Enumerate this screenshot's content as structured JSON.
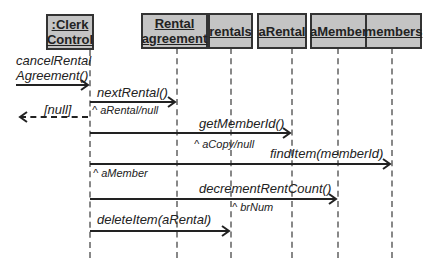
{
  "objects": [
    {
      "id": "clerk",
      "line1": ":Clerk",
      "line2": "Control"
    },
    {
      "id": "rental_agreement",
      "line1": "Rental",
      "line2": "agreement"
    },
    {
      "id": "rentals",
      "label": "rentals"
    },
    {
      "id": "arental",
      "label": "aRental"
    },
    {
      "id": "amember",
      "label": "aMember"
    },
    {
      "id": "members",
      "label": "members"
    }
  ],
  "messages": [
    {
      "label_line1": "cancelRental",
      "label_line2": "Agreement()",
      "from": "actor",
      "to": "clerk"
    },
    {
      "label": "nextRental()",
      "return": "^ aRental/null",
      "from": "clerk",
      "to": "rental_agreement"
    },
    {
      "label": "[null]",
      "type": "return",
      "from": "clerk",
      "to": "actor"
    },
    {
      "label": "getMemberId()",
      "return": "^ aCopy/null",
      "from": "clerk",
      "to": "arental"
    },
    {
      "label": "findItem(memberId)",
      "return": "^ aMember",
      "from": "clerk",
      "to": "members"
    },
    {
      "label": "decrementRentCount()",
      "return": "^ brNum",
      "from": "clerk",
      "to": "amember"
    },
    {
      "label": "deleteItem(aRental)",
      "from": "clerk",
      "to": "rentals"
    }
  ],
  "colors": {
    "box_fill": "#c4c4c4",
    "box_border": "#333333",
    "lifeline": "#888888",
    "line": "#222222"
  }
}
